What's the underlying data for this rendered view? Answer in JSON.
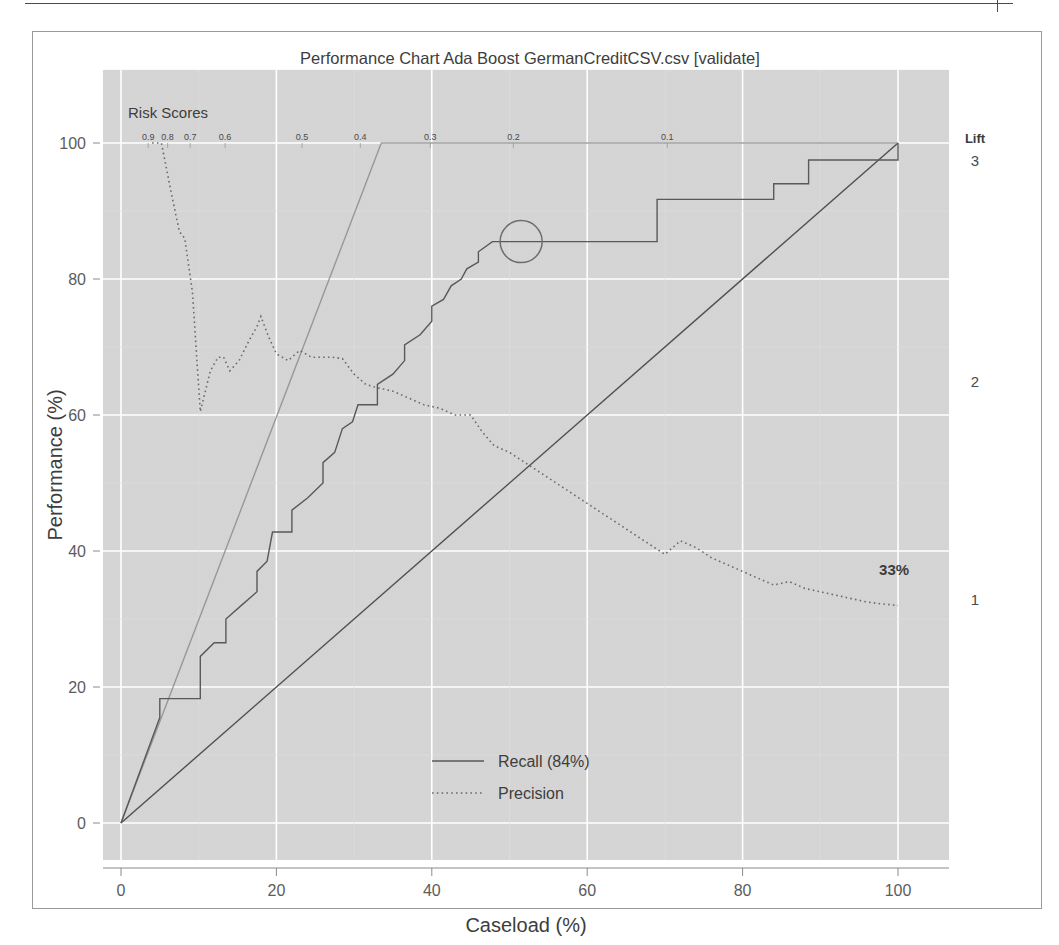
{
  "window": {
    "top_rule_present": true
  },
  "chart_data": {
    "type": "line",
    "title": "Performance Chart Ada Boost GermanCreditCSV.csv [validate]",
    "xlabel": "Caseload (%)",
    "ylabel": "Performance (%)",
    "xlim": [
      -4,
      104
    ],
    "ylim": [
      -4,
      106
    ],
    "xticks": [
      0,
      20,
      40,
      60,
      80,
      100
    ],
    "xticklabels": [
      "0",
      "20",
      "40",
      "60",
      "80",
      "100"
    ],
    "yticks": [
      0,
      20,
      40,
      60,
      80,
      100
    ],
    "yticklabels": [
      "0",
      "20",
      "40",
      "60",
      "80",
      "100"
    ],
    "grid": true,
    "panel_background": "#d6d6d6",
    "grid_color": "#ffffff",
    "legend": {
      "position": "bottom-center",
      "entries": [
        {
          "label": "Recall (84%)",
          "style": "solid",
          "color": "#595959"
        },
        {
          "label": "Precision",
          "style": "dotted",
          "color": "#6b6b6b"
        }
      ]
    },
    "secondary_axis_top": {
      "title": "Risk Scores",
      "ticklabels": [
        "0.9",
        "0.8",
        "0.7",
        "0.6",
        "0.5",
        "0.4",
        "0.3",
        "0.2",
        "0.1"
      ],
      "tick_x_percent": [
        3.5,
        6.0,
        8.9,
        13.4,
        23.3,
        30.8,
        39.8,
        50.5,
        70.3
      ]
    },
    "secondary_axis_right": {
      "title": "Lift",
      "ticklabels": [
        "3",
        "2",
        "1"
      ],
      "tick_y_performance": [
        97.5,
        65.0,
        33.0
      ]
    },
    "annotations": [
      {
        "type": "text",
        "text": "33%",
        "x_percent": 99.5,
        "y_performance": 36.5
      },
      {
        "type": "circle",
        "x_percent": 51.5,
        "y_performance": 85.5,
        "radius_px": 21,
        "color": "#6d6d6d"
      }
    ],
    "series": [
      {
        "name": "Baseline",
        "style": "solid",
        "color": "#4f4f4f",
        "points": [
          [
            0,
            0
          ],
          [
            100,
            100
          ]
        ]
      },
      {
        "name": "Ideal",
        "style": "solid",
        "color": "#8d8d8d",
        "points": [
          [
            0,
            0
          ],
          [
            33.5,
            100
          ],
          [
            100,
            100
          ]
        ]
      },
      {
        "name": "Recall (84%)",
        "style": "solid",
        "color": "#595959",
        "points": [
          [
            0,
            0
          ],
          [
            5.0,
            15.5
          ],
          [
            5.0,
            18.3
          ],
          [
            10.2,
            18.3
          ],
          [
            10.2,
            24.5
          ],
          [
            12.0,
            26.5
          ],
          [
            13.5,
            26.5
          ],
          [
            13.5,
            30.0
          ],
          [
            15.5,
            32.0
          ],
          [
            17.5,
            34.0
          ],
          [
            17.5,
            37.0
          ],
          [
            18.8,
            38.5
          ],
          [
            19.5,
            42.8
          ],
          [
            22.0,
            42.8
          ],
          [
            22.0,
            46.0
          ],
          [
            24.0,
            47.8
          ],
          [
            26.0,
            50.0
          ],
          [
            26.0,
            53.0
          ],
          [
            27.5,
            54.5
          ],
          [
            28.5,
            58.0
          ],
          [
            29.8,
            59.0
          ],
          [
            30.5,
            61.5
          ],
          [
            33.0,
            61.5
          ],
          [
            33.0,
            64.5
          ],
          [
            35.0,
            66.0
          ],
          [
            36.5,
            68.0
          ],
          [
            36.5,
            70.3
          ],
          [
            38.5,
            71.8
          ],
          [
            40.0,
            73.8
          ],
          [
            40.0,
            76.0
          ],
          [
            41.5,
            77.0
          ],
          [
            42.5,
            79.0
          ],
          [
            43.8,
            80.0
          ],
          [
            44.5,
            81.5
          ],
          [
            46.0,
            82.5
          ],
          [
            46.0,
            84.0
          ],
          [
            47.8,
            85.5
          ],
          [
            48.5,
            85.5
          ],
          [
            69.0,
            85.5
          ],
          [
            69.0,
            91.7
          ],
          [
            84.0,
            91.7
          ],
          [
            84.0,
            94.0
          ],
          [
            88.5,
            94.0
          ],
          [
            88.5,
            97.5
          ],
          [
            100,
            97.5
          ],
          [
            100,
            100
          ]
        ]
      },
      {
        "name": "Precision",
        "style": "dotted",
        "color": "#6b6b6b",
        "points": [
          [
            4.0,
            100
          ],
          [
            5.2,
            100
          ],
          [
            6.5,
            92.5
          ],
          [
            7.5,
            87.0
          ],
          [
            8.2,
            86.0
          ],
          [
            9.2,
            78.0
          ],
          [
            10.2,
            60.5
          ],
          [
            11.5,
            66.5
          ],
          [
            12.5,
            68.5
          ],
          [
            13.2,
            68.5
          ],
          [
            14.0,
            66.5
          ],
          [
            15.2,
            68.0
          ],
          [
            16.5,
            71.0
          ],
          [
            17.5,
            73.0
          ],
          [
            18.0,
            74.5
          ],
          [
            19.0,
            71.5
          ],
          [
            20.0,
            69.0
          ],
          [
            21.5,
            68.0
          ],
          [
            23.0,
            69.5
          ],
          [
            24.5,
            68.5
          ],
          [
            26.0,
            68.5
          ],
          [
            27.2,
            68.5
          ],
          [
            28.5,
            68.3
          ],
          [
            30.0,
            66.0
          ],
          [
            31.5,
            64.5
          ],
          [
            33.0,
            64.0
          ],
          [
            35.0,
            63.5
          ],
          [
            37.0,
            62.5
          ],
          [
            39.0,
            61.5
          ],
          [
            41.0,
            61.0
          ],
          [
            43.0,
            60.0
          ],
          [
            45.0,
            60.0
          ],
          [
            46.5,
            57.5
          ],
          [
            48.0,
            55.5
          ],
          [
            50.0,
            54.5
          ],
          [
            52.0,
            53.0
          ],
          [
            54.0,
            51.5
          ],
          [
            56.0,
            50.0
          ],
          [
            58.0,
            48.5
          ],
          [
            60.0,
            47.0
          ],
          [
            62.0,
            45.5
          ],
          [
            64.0,
            44.0
          ],
          [
            66.0,
            42.5
          ],
          [
            68.0,
            41.0
          ],
          [
            70.0,
            39.5
          ],
          [
            72.0,
            41.5
          ],
          [
            74.0,
            40.5
          ],
          [
            76.0,
            39.0
          ],
          [
            78.0,
            38.0
          ],
          [
            80.0,
            37.0
          ],
          [
            82.0,
            36.0
          ],
          [
            84.0,
            35.0
          ],
          [
            86.0,
            35.5
          ],
          [
            88.0,
            34.5
          ],
          [
            90.0,
            34.0
          ],
          [
            92.0,
            33.5
          ],
          [
            94.0,
            33.0
          ],
          [
            96.0,
            32.5
          ],
          [
            98.0,
            32.2
          ],
          [
            100,
            32.0
          ]
        ]
      }
    ]
  }
}
